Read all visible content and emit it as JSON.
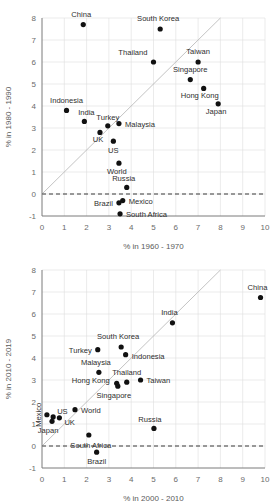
{
  "figure": {
    "name": "two-panel-scatter-gdp-growth",
    "panels": [
      "chart-top",
      "chart-bottom"
    ]
  },
  "chart_data": [
    {
      "id": "top",
      "type": "scatter",
      "title": "",
      "xlabel": "% in 1960 - 1970",
      "ylabel": "% in 1980 - 1990",
      "xlim": [
        0,
        10
      ],
      "ylim": [
        -1,
        8
      ],
      "xticks": [
        0,
        1,
        2,
        3,
        4,
        5,
        6,
        7,
        8,
        9,
        10
      ],
      "yticks": [
        -1,
        0,
        1,
        2,
        3,
        4,
        5,
        6,
        7,
        8
      ],
      "grid": true,
      "legend": "none",
      "annotations": {
        "identity_line": {
          "from": [
            0,
            0
          ],
          "to": [
            8,
            8
          ],
          "style": "solid-grey"
        },
        "zero_line": {
          "y": 0,
          "style": "dashed-black"
        }
      },
      "points": [
        {
          "label": "China",
          "x": 1.85,
          "y": 7.7,
          "lx": -2,
          "ly": -8,
          "anchor": "middle"
        },
        {
          "label": "South Korea",
          "x": 5.3,
          "y": 7.5,
          "lx": -2,
          "ly": -8,
          "anchor": "middle"
        },
        {
          "label": "Thailand",
          "x": 5.0,
          "y": 6.0,
          "lx": -6,
          "ly": -7,
          "anchor": "end"
        },
        {
          "label": "Taiwan",
          "x": 7.0,
          "y": 6.0,
          "lx": 0,
          "ly": -8,
          "anchor": "middle"
        },
        {
          "label": "Singapore",
          "x": 6.65,
          "y": 5.2,
          "lx": 0,
          "ly": -8,
          "anchor": "middle"
        },
        {
          "label": "Hong Kong",
          "x": 7.25,
          "y": 4.8,
          "lx": -4,
          "ly": 10,
          "anchor": "middle"
        },
        {
          "label": "Japan",
          "x": 7.9,
          "y": 4.1,
          "lx": -2,
          "ly": 10,
          "anchor": "middle"
        },
        {
          "label": "Indonesia",
          "x": 1.1,
          "y": 3.8,
          "lx": 0,
          "ly": -7,
          "anchor": "middle"
        },
        {
          "label": "India",
          "x": 1.9,
          "y": 3.3,
          "lx": 2,
          "ly": -6,
          "anchor": "middle"
        },
        {
          "label": "Turkey",
          "x": 2.95,
          "y": 3.1,
          "lx": 0,
          "ly": -6,
          "anchor": "middle"
        },
        {
          "label": "Malaysia",
          "x": 3.45,
          "y": 3.2,
          "lx": 6,
          "ly": 3,
          "anchor": "start"
        },
        {
          "label": "UK",
          "x": 2.6,
          "y": 2.8,
          "lx": -2,
          "ly": 10,
          "anchor": "middle"
        },
        {
          "label": "US",
          "x": 3.2,
          "y": 2.4,
          "lx": 0,
          "ly": 12,
          "anchor": "middle"
        },
        {
          "label": "World",
          "x": 3.45,
          "y": 1.4,
          "lx": -2,
          "ly": 11,
          "anchor": "middle"
        },
        {
          "label": "Russia",
          "x": 3.8,
          "y": 0.3,
          "lx": -3,
          "ly": -6,
          "anchor": "middle"
        },
        {
          "label": "Brazil",
          "x": 3.45,
          "y": -0.4,
          "lx": -6,
          "ly": 3,
          "anchor": "end"
        },
        {
          "label": "Mexico",
          "x": 3.62,
          "y": -0.3,
          "lx": 6,
          "ly": 3,
          "anchor": "start"
        },
        {
          "label": "South Africa",
          "x": 3.5,
          "y": -0.9,
          "lx": 6,
          "ly": 3,
          "anchor": "start"
        }
      ]
    },
    {
      "id": "bottom",
      "type": "scatter",
      "title": "",
      "xlabel": "% in 2000 - 2010",
      "ylabel": "% in 2010 - 2019",
      "xlim": [
        0,
        10
      ],
      "ylim": [
        -1,
        8
      ],
      "xticks": [
        0,
        1,
        2,
        3,
        4,
        5,
        6,
        7,
        8,
        9,
        10
      ],
      "yticks": [
        -1,
        0,
        1,
        2,
        3,
        4,
        5,
        6,
        7,
        8
      ],
      "grid": true,
      "legend": "none",
      "annotations": {
        "identity_line": {
          "from": [
            0,
            0
          ],
          "to": [
            8,
            8
          ],
          "style": "solid-grey"
        },
        "zero_line": {
          "y": 0,
          "style": "dashed-black"
        }
      },
      "points": [
        {
          "label": "China",
          "x": 9.8,
          "y": 6.75,
          "lx": -3,
          "ly": -8,
          "anchor": "middle"
        },
        {
          "label": "India",
          "x": 5.85,
          "y": 5.6,
          "lx": -3,
          "ly": -8,
          "anchor": "middle"
        },
        {
          "label": "South Korea",
          "x": 3.55,
          "y": 4.5,
          "lx": -3,
          "ly": -8,
          "anchor": "middle"
        },
        {
          "label": "Indonesia",
          "x": 3.75,
          "y": 4.15,
          "lx": 6,
          "ly": 4,
          "anchor": "start"
        },
        {
          "label": "Turkey",
          "x": 2.5,
          "y": 4.38,
          "lx": -6,
          "ly": 3,
          "anchor": "end"
        },
        {
          "label": "Malaysia",
          "x": 2.55,
          "y": 3.35,
          "lx": -3,
          "ly": -7,
          "anchor": "middle"
        },
        {
          "label": "Thailand",
          "x": 3.8,
          "y": 2.9,
          "lx": 0,
          "ly": -7,
          "anchor": "middle"
        },
        {
          "label": "Hong Kong",
          "x": 3.35,
          "y": 2.85,
          "lx": -7,
          "ly": 0,
          "anchor": "end"
        },
        {
          "label": "Singapore",
          "x": 3.4,
          "y": 2.72,
          "lx": -4,
          "ly": 12,
          "anchor": "middle"
        },
        {
          "label": "Taiwan",
          "x": 4.42,
          "y": 3.0,
          "lx": 6,
          "ly": 3,
          "anchor": "start"
        },
        {
          "label": "Mexico",
          "x": 0.22,
          "y": 1.42,
          "lx": -6,
          "ly": 0,
          "anchor": "middle",
          "rotate": true
        },
        {
          "label": "US",
          "x": 0.5,
          "y": 1.32,
          "lx": 4,
          "ly": -3,
          "anchor": "start"
        },
        {
          "label": "UK",
          "x": 0.78,
          "y": 1.28,
          "lx": 5,
          "ly": 7,
          "anchor": "start"
        },
        {
          "label": "Japan",
          "x": 0.45,
          "y": 1.12,
          "lx": -4,
          "ly": 12,
          "anchor": "middle"
        },
        {
          "label": "World",
          "x": 1.48,
          "y": 1.65,
          "lx": 6,
          "ly": 3,
          "anchor": "start"
        },
        {
          "label": "Russia",
          "x": 5.02,
          "y": 0.8,
          "lx": -4,
          "ly": -6,
          "anchor": "middle"
        },
        {
          "label": "South Africa",
          "x": 2.1,
          "y": 0.5,
          "lx": 2,
          "ly": 13,
          "anchor": "middle"
        },
        {
          "label": "Brazil",
          "x": 2.45,
          "y": -0.28,
          "lx": 0,
          "ly": 12,
          "anchor": "middle"
        }
      ]
    }
  ]
}
